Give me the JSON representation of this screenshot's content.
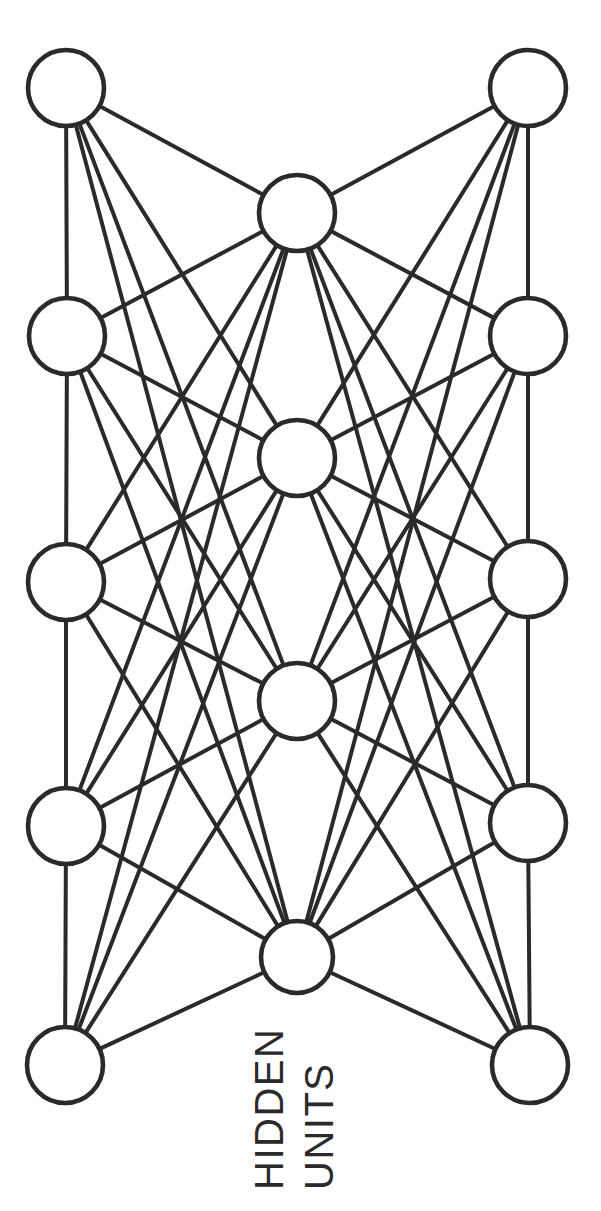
{
  "figure": {
    "kind": "neural-network-diagram",
    "orientation": "rotated-90-ccw",
    "background_color": "#ffffff",
    "ink_color": "#2a2a2a",
    "stroke_width": 4,
    "width": 601,
    "height": 1211
  },
  "caption": {
    "line1": "HIDDEN",
    "line2": "UNITS",
    "rotation_deg": -90,
    "color": "#2a2a2a",
    "font_size": 40
  },
  "chart_data": {
    "type": "diagram",
    "title": "HIDDEN UNITS",
    "graph_kind": "fully-connected bipartite network",
    "layers": [
      {
        "name": "left-column",
        "role": "input/output units",
        "count": 5,
        "node_radius": 38,
        "nodes": [
          {
            "id": "L1",
            "cx": 66,
            "cy": 88,
            "r": 38
          },
          {
            "id": "L2",
            "cx": 67,
            "cy": 336,
            "r": 38
          },
          {
            "id": "L3",
            "cx": 66,
            "cy": 582,
            "r": 38
          },
          {
            "id": "L4",
            "cx": 66,
            "cy": 826,
            "r": 38
          },
          {
            "id": "L5",
            "cx": 65,
            "cy": 1065,
            "r": 38
          }
        ]
      },
      {
        "name": "hidden-column",
        "role": "hidden units",
        "count": 4,
        "node_radius": 37,
        "nodes": [
          {
            "id": "H1",
            "cx": 297,
            "cy": 213,
            "r": 38
          },
          {
            "id": "H2",
            "cx": 297,
            "cy": 458,
            "r": 38
          },
          {
            "id": "H3",
            "cx": 297,
            "cy": 701,
            "r": 38
          },
          {
            "id": "H4",
            "cx": 297,
            "cy": 957,
            "r": 36
          }
        ]
      },
      {
        "name": "right-column",
        "role": "input/output units",
        "count": 5,
        "node_radius": 38,
        "nodes": [
          {
            "id": "R1",
            "cx": 528,
            "cy": 88,
            "r": 38
          },
          {
            "id": "R2",
            "cx": 528,
            "cy": 336,
            "r": 38
          },
          {
            "id": "R3",
            "cx": 528,
            "cy": 579,
            "r": 38
          },
          {
            "id": "R4",
            "cx": 528,
            "cy": 823,
            "r": 38
          },
          {
            "id": "R5",
            "cx": 530,
            "cy": 1065,
            "r": 38
          }
        ]
      }
    ],
    "edge_rule": "every hidden unit connects to every left-column unit and every right-column unit; adjacent units within the left column and within the right column are also connected vertically",
    "edges": [
      [
        "H1",
        "L1"
      ],
      [
        "H1",
        "L2"
      ],
      [
        "H1",
        "L3"
      ],
      [
        "H1",
        "L4"
      ],
      [
        "H1",
        "L5"
      ],
      [
        "H1",
        "R1"
      ],
      [
        "H1",
        "R2"
      ],
      [
        "H1",
        "R3"
      ],
      [
        "H1",
        "R4"
      ],
      [
        "H1",
        "R5"
      ],
      [
        "H2",
        "L1"
      ],
      [
        "H2",
        "L2"
      ],
      [
        "H2",
        "L3"
      ],
      [
        "H2",
        "L4"
      ],
      [
        "H2",
        "L5"
      ],
      [
        "H2",
        "R1"
      ],
      [
        "H2",
        "R2"
      ],
      [
        "H2",
        "R3"
      ],
      [
        "H2",
        "R4"
      ],
      [
        "H2",
        "R5"
      ],
      [
        "H3",
        "L1"
      ],
      [
        "H3",
        "L2"
      ],
      [
        "H3",
        "L3"
      ],
      [
        "H3",
        "L4"
      ],
      [
        "H3",
        "L5"
      ],
      [
        "H3",
        "R1"
      ],
      [
        "H3",
        "R2"
      ],
      [
        "H3",
        "R3"
      ],
      [
        "H3",
        "R4"
      ],
      [
        "H3",
        "R5"
      ],
      [
        "H4",
        "L1"
      ],
      [
        "H4",
        "L2"
      ],
      [
        "H4",
        "L3"
      ],
      [
        "H4",
        "L4"
      ],
      [
        "H4",
        "L5"
      ],
      [
        "H4",
        "R1"
      ],
      [
        "H4",
        "R2"
      ],
      [
        "H4",
        "R3"
      ],
      [
        "H4",
        "R4"
      ],
      [
        "H4",
        "R5"
      ],
      [
        "L1",
        "L2"
      ],
      [
        "L2",
        "L3"
      ],
      [
        "L3",
        "L4"
      ],
      [
        "L4",
        "L5"
      ],
      [
        "R1",
        "R2"
      ],
      [
        "R2",
        "R3"
      ],
      [
        "R3",
        "R4"
      ],
      [
        "R4",
        "R5"
      ]
    ],
    "edge_count": 48,
    "node_count": 14,
    "annotations": [
      "HIDDEN",
      "UNITS"
    ]
  }
}
